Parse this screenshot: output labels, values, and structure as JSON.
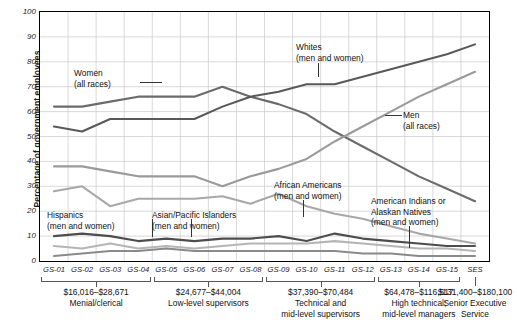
{
  "axis": {
    "ylabel": "Percentage of government employees",
    "yticks": [
      "100",
      "90",
      "80",
      "70",
      "60",
      "50",
      "40",
      "30",
      "20",
      "10",
      "0"
    ],
    "xticks": [
      "GS-01",
      "GS-02",
      "GS-03",
      "GS-04",
      "GS-05",
      "GS-06",
      "GS-07",
      "GS-08",
      "GS-09",
      "GS-10",
      "GS-11",
      "GS-12",
      "GS-13",
      "GS-14",
      "GS-15",
      "SES"
    ]
  },
  "groups": [
    {
      "amount": "$16,016–$28,671",
      "desc": "Menial/clerical"
    },
    {
      "amount": "$24,677–$44,004",
      "desc": "Low-level supervisors"
    },
    {
      "amount": "$37,390–$70,484",
      "desc": "Technical and\nmid-level supervisors"
    },
    {
      "amount": "$64,478–$116,517",
      "desc": "High technical;\nmid-level managers"
    },
    {
      "amount": "$131,400–$180,100",
      "desc": "Senior Executive\nService"
    }
  ],
  "annotations": [
    {
      "name": "women-label",
      "line1": "Women",
      "line2": "(all races)"
    },
    {
      "name": "whites-label",
      "line1": "Whites",
      "line2": "(men and women)"
    },
    {
      "name": "men-label",
      "line1": "Men",
      "line2": "(all races)"
    },
    {
      "name": "hispanics-label",
      "line1": "Hispanics",
      "line2": "(men and women)"
    },
    {
      "name": "asian-pacific-label",
      "line1": "Asian/Pacific Islanders",
      "line2": "(men and women)"
    },
    {
      "name": "african-americans-label",
      "line1": "African Americans",
      "line2": "(men and women)"
    },
    {
      "name": "american-indians-label",
      "line1": "American Indians or",
      "line2": "Alaskan Natives",
      "line3": "(men and women)"
    }
  ],
  "chart_data": {
    "type": "line",
    "title": "",
    "xlabel": "",
    "ylabel": "Percentage of government employees",
    "ylim": [
      0,
      100
    ],
    "yticks": [
      0,
      10,
      20,
      30,
      40,
      50,
      60,
      70,
      80,
      90,
      100
    ],
    "grid": true,
    "legend": "inline-annotations",
    "categories": [
      "GS-01",
      "GS-02",
      "GS-03",
      "GS-04",
      "GS-05",
      "GS-06",
      "GS-07",
      "GS-08",
      "GS-09",
      "GS-10",
      "GS-11",
      "GS-12",
      "GS-13",
      "GS-14",
      "GS-15",
      "SES"
    ],
    "series": [
      {
        "name": "Women (all races)",
        "color": "#6b6b6b",
        "values": [
          62,
          62,
          64,
          66,
          66,
          66,
          70,
          66,
          63,
          59,
          52,
          46,
          40,
          34,
          29,
          24
        ]
      },
      {
        "name": "Men (all races)",
        "color": "#9a9a9a",
        "values": [
          38,
          38,
          36,
          34,
          34,
          34,
          30,
          34,
          37,
          41,
          48,
          54,
          60,
          66,
          71,
          76
        ]
      },
      {
        "name": "Whites (men and women)",
        "color": "#595959",
        "values": [
          54,
          52,
          57,
          57,
          57,
          57,
          62,
          66,
          68,
          71,
          71,
          74,
          77,
          80,
          83,
          87
        ]
      },
      {
        "name": "African Americans (men and women)",
        "color": "#a8a8a8",
        "values": [
          28,
          30,
          22,
          25,
          25,
          25,
          26,
          23,
          27,
          22,
          19,
          17,
          14,
          11,
          9,
          7
        ]
      },
      {
        "name": "Hispanics (men and women)",
        "color": "#4d4d4d",
        "values": [
          10,
          11,
          10,
          8,
          9,
          8,
          9,
          9,
          10,
          8,
          11,
          9,
          8,
          7,
          6,
          6
        ]
      },
      {
        "name": "Asian/Pacific Islanders (men and women)",
        "color": "#b5b5b5",
        "values": [
          6,
          5,
          7,
          5,
          6,
          5,
          6,
          7,
          7,
          7,
          8,
          7,
          6,
          5,
          5,
          4
        ]
      },
      {
        "name": "American Indians or Alaskan Natives (men and women)",
        "color": "#8a8a8a",
        "values": [
          2,
          3,
          4,
          4,
          5,
          4,
          4,
          4,
          4,
          4,
          4,
          3,
          3,
          2,
          2,
          2
        ]
      }
    ]
  }
}
